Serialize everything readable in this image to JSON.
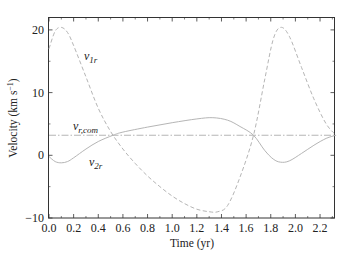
{
  "chart_data": {
    "type": "line",
    "title": "",
    "xlabel": "Time (yr)",
    "ylabel": "Velocity (km s⁻¹)",
    "xlim": [
      0.0,
      2.33
    ],
    "ylim": [
      -10,
      22
    ],
    "xticks": [
      0.0,
      0.2,
      0.4,
      0.6,
      0.8,
      1.0,
      1.2,
      1.4,
      1.6,
      1.8,
      2.0,
      2.2
    ],
    "xtick_labels": [
      "0.0",
      "0.2",
      "0.4",
      "0.6",
      "0.8",
      "1.0",
      "1.2",
      "1.4",
      "1.6",
      "1.8",
      "2.0",
      "2.2"
    ],
    "yticks": [
      -10,
      0,
      10,
      20
    ],
    "ytick_labels": [
      "−10",
      "0",
      "10",
      "20"
    ],
    "grid": false,
    "legend": "inline labels",
    "series": [
      {
        "name": "v_1r",
        "label_main": "v",
        "label_sub": "1r",
        "style": "dashed",
        "x": [
          0.0,
          0.05,
          0.1,
          0.15,
          0.2,
          0.3,
          0.4,
          0.5,
          0.6,
          0.7,
          0.8,
          0.9,
          1.0,
          1.1,
          1.2,
          1.3,
          1.37,
          1.45,
          1.55,
          1.66,
          1.75,
          1.82,
          1.88,
          1.95,
          2.05,
          2.15,
          2.25,
          2.33
        ],
        "values": [
          17.0,
          19.8,
          20.4,
          19.6,
          17.5,
          12.5,
          7.5,
          3.8,
          1.0,
          -1.3,
          -3.3,
          -5.0,
          -6.5,
          -7.7,
          -8.6,
          -9.0,
          -9.0,
          -8.0,
          -3.5,
          3.2,
          12.0,
          18.5,
          20.4,
          19.0,
          14.0,
          9.0,
          5.0,
          3.2
        ]
      },
      {
        "name": "v_2r",
        "label_main": "v",
        "label_sub": "2r",
        "style": "solid",
        "x": [
          0.0,
          0.05,
          0.1,
          0.15,
          0.2,
          0.3,
          0.4,
          0.52,
          0.6,
          0.8,
          1.0,
          1.2,
          1.33,
          1.45,
          1.55,
          1.66,
          1.75,
          1.82,
          1.88,
          1.95,
          2.05,
          2.15,
          2.25,
          2.33
        ],
        "values": [
          -0.2,
          -1.0,
          -1.2,
          -1.0,
          -0.4,
          1.0,
          2.2,
          3.2,
          3.7,
          4.5,
          5.2,
          5.8,
          6.0,
          5.6,
          4.6,
          3.2,
          0.8,
          -0.6,
          -1.1,
          -0.9,
          0.3,
          1.6,
          2.7,
          3.2
        ]
      },
      {
        "name": "v_r,com",
        "label_main": "v",
        "label_sub": "r,com",
        "style": "dash-dot",
        "x": [
          0.0,
          2.33
        ],
        "values": [
          3.2,
          3.2
        ]
      }
    ],
    "annotations": [
      {
        "text": "v_1r",
        "x": 0.3,
        "y": 16
      },
      {
        "text": "v_r,com",
        "x": 0.15,
        "y": 4.5
      },
      {
        "text": "v_2r",
        "x": 0.32,
        "y": -1.5
      }
    ]
  },
  "labels": {
    "xlabel": "Time (yr)",
    "ylabel_main": "Velocity (km s",
    "ylabel_sup": "−1",
    "ylabel_end": ")",
    "v1r_main": "v",
    "v1r_sub": "1r",
    "v2r_main": "v",
    "v2r_sub": "2r",
    "vcom_main": "v",
    "vcom_sub": "r,com"
  },
  "colors": {
    "axis": "#333333",
    "v1r": "#b5b5b5",
    "v2r": "#b5b5b5",
    "vcom": "#b5b5b5"
  }
}
